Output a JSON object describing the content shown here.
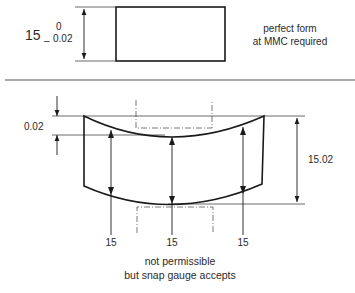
{
  "top": {
    "nominal": "15",
    "upper_tol": "0",
    "lower_sign": "–",
    "lower_tol": "0.02",
    "note_line1": "perfect form",
    "note_line2": "at MMC required"
  },
  "bottom": {
    "form_dev": "0.02",
    "overall": "15.02",
    "local_left": "15",
    "local_mid": "15",
    "local_right": "15",
    "note_line1": "not permissible",
    "note_line2": "but snap gauge accepts"
  },
  "colors": {
    "line": "#1a1a1a",
    "thin": "#444444",
    "text": "#2a2a2a"
  }
}
